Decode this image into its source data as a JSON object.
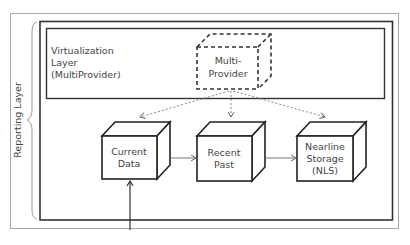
{
  "diagram": {
    "outer_label": "Reporting Layer",
    "virtualization": {
      "line1": "Virtualization",
      "line2": "Layer",
      "line3": "(MultiProvider)"
    },
    "multiprovider": {
      "line1": "Multi-",
      "line2": "Provider"
    },
    "nodes": [
      {
        "id": "current",
        "line1": "Current",
        "line2": "Data"
      },
      {
        "id": "recent",
        "line1": "Recent",
        "line2": "Past"
      },
      {
        "id": "nls",
        "line1": "Nearline",
        "line2": "Storage",
        "line3": "(NLS)"
      }
    ],
    "colors": {
      "border_outer": "#a8a8a8",
      "border_inner": "#333333",
      "arrow_dotted": "#777777",
      "arrow_solid": "#555555"
    }
  }
}
